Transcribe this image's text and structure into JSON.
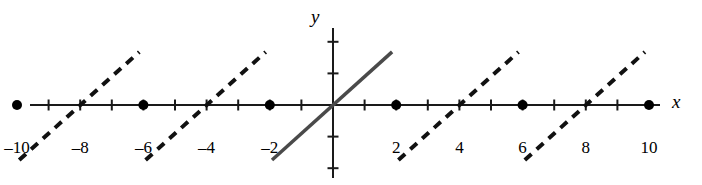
{
  "figure": {
    "width": 702,
    "height": 185,
    "background": "#ffffff",
    "ink_color": "#1a1a1a"
  },
  "axes": {
    "x_axis_label": "x",
    "y_axis_label": "y",
    "origin_px": [
      333,
      105
    ],
    "unit_px": 31.6,
    "x_axis_y_px": 105,
    "y_axis_x_px": 333,
    "x_axis_start_px": 30,
    "x_axis_end_px": 660,
    "y_axis_top_px": 28,
    "y_axis_bottom_px": 178,
    "tick_length_px": 11,
    "x_tick_values": [
      -9,
      -8,
      -7,
      -6,
      -5,
      -4,
      -3,
      -2,
      -1,
      1,
      2,
      3,
      4,
      5,
      6,
      7,
      8,
      9
    ],
    "y_tick_values": [
      -2,
      -1,
      1,
      2
    ],
    "labeled_ticks": [
      {
        "value": -10,
        "text": "–10"
      },
      {
        "value": -8,
        "text": "–8"
      },
      {
        "value": -6,
        "text": "–6"
      },
      {
        "value": -4,
        "text": "–4"
      },
      {
        "value": -2,
        "text": "–2"
      },
      {
        "value": 2,
        "text": "2"
      },
      {
        "value": 4,
        "text": "4"
      },
      {
        "value": 6,
        "text": "6"
      },
      {
        "value": 8,
        "text": "8"
      },
      {
        "value": 10,
        "text": "10"
      }
    ],
    "tick_label_y_px": 138
  },
  "chart_data": {
    "type": "line",
    "title": "",
    "subtitle": "",
    "xlabel": "x",
    "ylabel": "y",
    "xlim": [
      -10.5,
      10.5
    ],
    "ylim": [
      -2.6,
      2.6
    ],
    "grid": false,
    "legend": null,
    "series": [
      {
        "name": "central-segment",
        "style": "solid",
        "color": "#4a4a4a",
        "linewidth_px": 3.5,
        "points": [
          [
            -1.93,
            -1.74
          ],
          [
            1.87,
            1.68
          ]
        ]
      },
      {
        "name": "segment-left-2",
        "style": "dashed",
        "color": "#111111",
        "linewidth_px": 4,
        "points": [
          [
            -9.93,
            -1.74
          ],
          [
            -6.13,
            1.68
          ]
        ]
      },
      {
        "name": "segment-left-1",
        "style": "dashed",
        "color": "#111111",
        "linewidth_px": 4,
        "points": [
          [
            -5.93,
            -1.74
          ],
          [
            -2.13,
            1.68
          ]
        ]
      },
      {
        "name": "segment-right-1",
        "style": "dashed",
        "color": "#111111",
        "linewidth_px": 4,
        "points": [
          [
            2.07,
            -1.74
          ],
          [
            5.87,
            1.68
          ]
        ]
      },
      {
        "name": "segment-right-2",
        "style": "dashed",
        "color": "#111111",
        "linewidth_px": 4,
        "points": [
          [
            6.07,
            -1.74
          ],
          [
            9.87,
            1.68
          ]
        ]
      }
    ],
    "points": {
      "name": "axis-dots",
      "marker": "filled-circle",
      "color": "#000000",
      "radius_px": 5,
      "x": [
        -10,
        -6,
        -2,
        2,
        6,
        10
      ],
      "y": [
        0,
        0,
        0,
        0,
        0,
        0
      ]
    },
    "dash_pattern_px": [
      9,
      7
    ]
  }
}
